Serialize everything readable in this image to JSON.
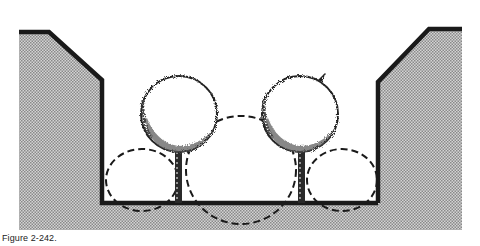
{
  "figure": {
    "caption": "Figure 2-242.",
    "colors": {
      "wall": "#1a1a1a",
      "soil_fill": "#b8b8b8",
      "dash": "#1a1a1a",
      "canopy_texture": "#333333",
      "background": "#ffffff"
    },
    "elements": {
      "left_embankment": "soil-embankment",
      "right_embankment": "soil-embankment",
      "planter_floor": "planter-floor",
      "trees": [
        {
          "label": "tree-left"
        },
        {
          "label": "tree-right"
        }
      ],
      "root_zones": [
        {
          "label": "root-zone-left"
        },
        {
          "label": "root-zone-center"
        },
        {
          "label": "root-zone-right"
        }
      ]
    }
  }
}
